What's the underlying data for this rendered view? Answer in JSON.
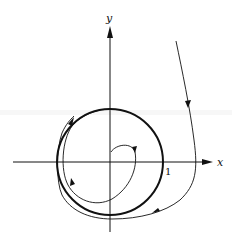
{
  "diagram": {
    "type": "phase-portrait",
    "axes": {
      "x_label": "x",
      "y_label": "y",
      "tick_label_x": "1"
    },
    "limit_cycle": {
      "shape": "unit-circle",
      "radius": 1,
      "stroke": "#111111"
    },
    "trajectories": [
      {
        "name": "inner-spiral",
        "description": "spirals outward from near origin toward the limit cycle"
      },
      {
        "name": "outer-trajectory",
        "description": "comes from upper right and spirals inward toward the limit cycle"
      }
    ],
    "colors": {
      "line": "#111111",
      "background": "#ffffff"
    }
  }
}
